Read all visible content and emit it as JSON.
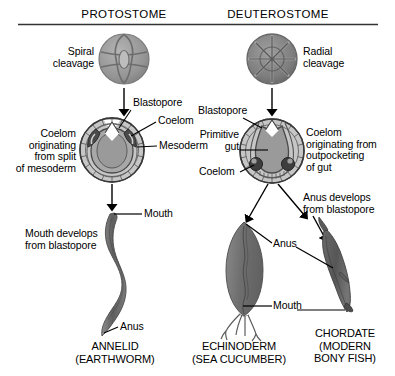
{
  "figure": {
    "headers": {
      "left": "PROTOSTOME",
      "right": "DEUTEROSTOME"
    },
    "left_column": {
      "cleavage_label": "Spiral\ncleavage",
      "cleavage_icon": "spiral-cleavage-embryo-icon",
      "embryo_labels": {
        "blastopore": "Blastopore",
        "coelom": "Coelom",
        "mesoderm": "Mesoderm",
        "coelom_origin": "Coelom\noriginating\nfrom split\nof mesoderm"
      },
      "adult_labels": {
        "mouth": "Mouth",
        "anus": "Anus",
        "mouth_origin": "Mouth develops\nfrom blastopore"
      },
      "caption": "ANNELID\n(EARTHWORM)"
    },
    "right_column": {
      "cleavage_label": "Radial\ncleavage",
      "cleavage_icon": "radial-cleavage-embryo-icon",
      "embryo_labels": {
        "blastopore": "Blastopore",
        "primitive_gut": "Primitive\ngut",
        "coelom": "Coelom",
        "coelom_origin": "Coelom\noriginating from\noutpocketing\nof gut"
      },
      "adult_labels": {
        "anus": "Anus",
        "mouth": "Mouth",
        "anus_origin": "Anus develops\nfrom blastopore"
      },
      "caption_left": "ECHINODERM\n(SEA CUCUMBER)",
      "caption_right": "CHORDATE\n(MODERN\nBONY FISH)"
    },
    "colors": {
      "ink": "#000000",
      "background": "#ffffff",
      "embryo_inner": "#9a9a9a",
      "embryo_outer": "#c6c6c6",
      "mesoderm_dark": "#4a4a4a",
      "animal_body": "#6f6f6f",
      "cleavage_cell": "#8f8f8f",
      "rule": "#333333"
    }
  }
}
